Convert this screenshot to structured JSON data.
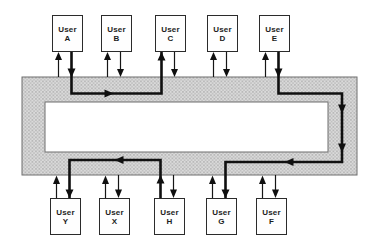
{
  "diagram": {
    "kind": "ring-network-topology",
    "ring": {
      "shape": "rectangular ring band",
      "fill_base": "#dadada",
      "fill_dots": "#8e8e8e",
      "hole_fill": "#ffffff",
      "edge_color": "#6f6f6f"
    },
    "line_color": "#101010",
    "top_nodes": [
      {
        "prefix": "User",
        "letter": "A"
      },
      {
        "prefix": "User",
        "letter": "B"
      },
      {
        "prefix": "User",
        "letter": "C"
      },
      {
        "prefix": "User",
        "letter": "D"
      },
      {
        "prefix": "User",
        "letter": "E"
      }
    ],
    "bottom_nodes": [
      {
        "prefix": "User",
        "letter": "Y"
      },
      {
        "prefix": "User",
        "letter": "X"
      },
      {
        "prefix": "User",
        "letter": "H"
      },
      {
        "prefix": "User",
        "letter": "G"
      },
      {
        "prefix": "User",
        "letter": "F"
      }
    ],
    "node_connections": "each user has one arrow into the ring and one arrow out of the ring",
    "messages": [
      {
        "from": "User A",
        "to": "User C",
        "route": "right along top band",
        "direction": "clockwise"
      },
      {
        "from": "User E",
        "to": "User G",
        "route": "right along top band, down right band, left along bottom band",
        "direction": "clockwise"
      },
      {
        "from": "User H",
        "to": "User Y",
        "route": "left along bottom band",
        "direction": "clockwise"
      }
    ]
  }
}
